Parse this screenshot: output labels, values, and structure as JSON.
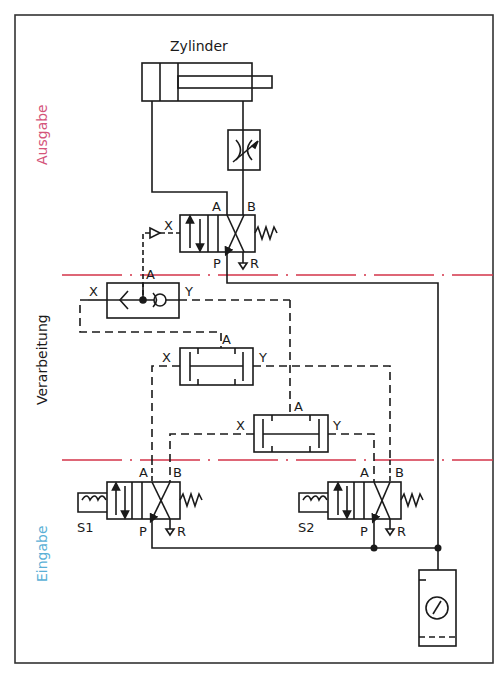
{
  "diagram": {
    "title": "Zylinder",
    "zones": {
      "output": {
        "label": "Ausgabe",
        "color": "#d4547a"
      },
      "processing": {
        "label": "Verarbeitung",
        "color": "#1a1a1a"
      },
      "input": {
        "label": "Eingabe",
        "color": "#5ab0d6"
      }
    },
    "separator_color": "#d4344a",
    "components": {
      "cylinder": {
        "label": "Zylinder"
      },
      "throttle_check_valve": {
        "label": ""
      },
      "main_valve": {
        "port_a": "A",
        "port_b": "B",
        "port_p": "P",
        "port_r": "R",
        "pilot": "X"
      },
      "shuttle_valve": {
        "port_x": "X",
        "port_y": "Y",
        "port_a": "A"
      },
      "and_valve_1": {
        "port_x": "X",
        "port_y": "Y",
        "port_a": "A"
      },
      "and_valve_2": {
        "port_x": "X",
        "port_y": "Y",
        "port_a": "A"
      },
      "valve_s1": {
        "label": "S1",
        "port_a": "A",
        "port_b": "B",
        "port_p": "P",
        "port_r": "R"
      },
      "valve_s2": {
        "label": "S2",
        "port_a": "A",
        "port_b": "B",
        "port_p": "P",
        "port_r": "R"
      },
      "service_unit": {
        "label": ""
      }
    }
  }
}
